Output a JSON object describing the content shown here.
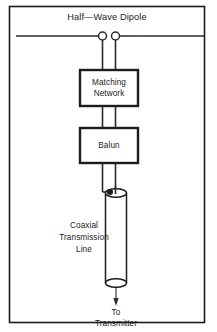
{
  "figure": {
    "title": "Half—Wave Dipole",
    "width": 217,
    "height": 332,
    "background_color": "#ffffff",
    "line_color": "#1c1c1c",
    "text_color": "#1a1a1a"
  },
  "antenna": {
    "label": "Half—Wave Dipole",
    "left_element_name": "dipole-left-arm",
    "right_element_name": "dipole-right-arm",
    "terminal_left_name": "feedpoint-terminal-left",
    "terminal_right_name": "feedpoint-terminal-right"
  },
  "components": [
    {
      "id": "matching-network",
      "label_line_1": "Matching",
      "label_line_2": "Network"
    },
    {
      "id": "balun",
      "label_line_1": "Balun",
      "label_line_2": ""
    }
  ],
  "cable": {
    "label_line_1": "Coaxial",
    "label_line_2": "Transmission",
    "label_line_3": "Line"
  },
  "destination": {
    "label_line_1": "To",
    "label_line_2": "Transmitter"
  },
  "icons": {
    "terminal": "circle-terminal-icon",
    "arrow": "arrow-down-icon",
    "cable": "coaxial-cable-icon"
  }
}
